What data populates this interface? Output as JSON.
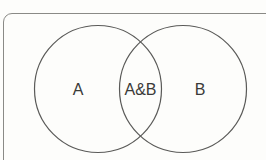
{
  "diagram": {
    "type": "venn",
    "sets": [
      {
        "id": "A",
        "label": "A"
      },
      {
        "id": "B",
        "label": "B"
      }
    ],
    "intersection": {
      "label": "A&B"
    },
    "colors": {
      "stroke": "#5a5a58",
      "frame": "#8a8a86",
      "text": "#3a3a38",
      "background": "#fdfdfb"
    }
  }
}
